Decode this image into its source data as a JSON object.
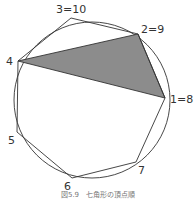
{
  "figure": {
    "caption": "図5.9　七角形の頂点順",
    "circle": {
      "cx": 92,
      "cy": 100,
      "r": 78
    },
    "fill_color": "#8c8c8c",
    "stroke_color": "#333333",
    "vertices": [
      {
        "id": "1",
        "label": "1=8",
        "x": 165,
        "y": 98
      },
      {
        "id": "2",
        "label": "2=9",
        "x": 138,
        "y": 34
      },
      {
        "id": "3",
        "label": "3=10",
        "x": 71,
        "y": 18
      },
      {
        "id": "4",
        "label": "4",
        "x": 18,
        "y": 61
      },
      {
        "id": "5",
        "label": "5",
        "x": 17,
        "y": 132
      },
      {
        "id": "6",
        "label": "6",
        "x": 72,
        "y": 178
      },
      {
        "id": "7",
        "label": "7",
        "x": 136,
        "y": 162
      }
    ],
    "shaded_triangle": [
      "4",
      "2",
      "1"
    ]
  }
}
